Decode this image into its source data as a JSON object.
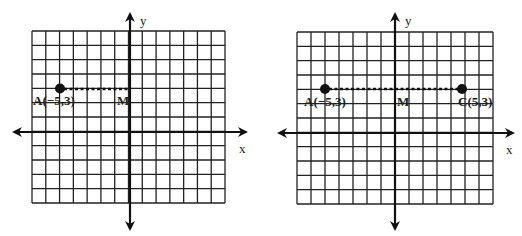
{
  "chart_data": [
    {
      "type": "scatter",
      "title": "",
      "xlabel": "x",
      "ylabel": "y",
      "xlim": [
        -7,
        7
      ],
      "ylim": [
        -5,
        7
      ],
      "grid": true,
      "points": [
        {
          "name": "A",
          "x": -5,
          "y": 3,
          "label": "A(−5,3)",
          "marked": true
        },
        {
          "name": "M",
          "x": 0,
          "y": 3,
          "label": "M",
          "marked": false
        }
      ],
      "segments": [
        {
          "from": "A",
          "to": "M",
          "style": "dotted"
        }
      ]
    },
    {
      "type": "scatter",
      "title": "",
      "xlabel": "x",
      "ylabel": "y",
      "xlim": [
        -7,
        7
      ],
      "ylim": [
        -5,
        7
      ],
      "grid": true,
      "points": [
        {
          "name": "A",
          "x": -5,
          "y": 3,
          "label": "A(−5,3)",
          "marked": true
        },
        {
          "name": "M",
          "x": 0,
          "y": 3,
          "label": "M",
          "marked": false
        },
        {
          "name": "C",
          "x": 5,
          "y": 3,
          "label": "C(5,3)",
          "marked": true
        }
      ],
      "segments": [
        {
          "from": "A",
          "to": "C",
          "style": "dotted"
        }
      ]
    }
  ],
  "graphs": [
    {
      "id": "left",
      "x_axis_label": "x",
      "y_axis_label": "y",
      "labels": {
        "A": "A(−5,3)",
        "M": "M"
      }
    },
    {
      "id": "right",
      "x_axis_label": "x",
      "y_axis_label": "y",
      "labels": {
        "A": "A(−5,3)",
        "M": "M",
        "C": "C(5,3)"
      }
    }
  ]
}
